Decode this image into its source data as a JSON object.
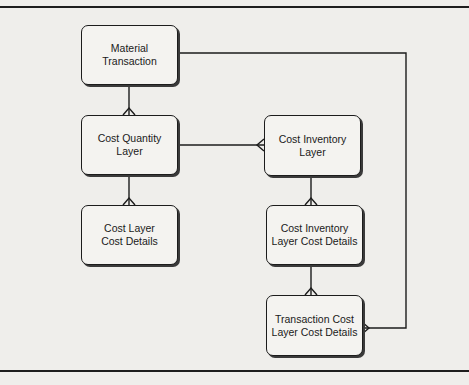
{
  "diagram": {
    "type": "entity-relationship",
    "entities": [
      {
        "id": "material_transaction",
        "label": "Material\nTransaction"
      },
      {
        "id": "cost_quantity_layer",
        "label": "Cost Quantity\nLayer"
      },
      {
        "id": "cost_layer_cost_details",
        "label": "Cost Layer\nCost Details"
      },
      {
        "id": "cost_inventory_layer",
        "label": "Cost Inventory\nLayer"
      },
      {
        "id": "cost_inventory_layer_cost_details",
        "label": "Cost Inventory\nLayer Cost Details"
      },
      {
        "id": "transaction_cost_layer_cost_details",
        "label": "Transaction Cost\nLayer Cost Details"
      }
    ],
    "relationships": [
      {
        "from": "material_transaction",
        "to": "cost_quantity_layer",
        "cardinality": "one-to-many"
      },
      {
        "from": "cost_quantity_layer",
        "to": "cost_layer_cost_details",
        "cardinality": "one-to-many"
      },
      {
        "from": "cost_quantity_layer",
        "to": "cost_inventory_layer",
        "cardinality": "one-to-many"
      },
      {
        "from": "cost_inventory_layer",
        "to": "cost_inventory_layer_cost_details",
        "cardinality": "one-to-many"
      },
      {
        "from": "cost_inventory_layer_cost_details",
        "to": "transaction_cost_layer_cost_details",
        "cardinality": "one-to-many"
      },
      {
        "from": "material_transaction",
        "to": "transaction_cost_layer_cost_details",
        "cardinality": "one-to-many"
      }
    ],
    "colors": {
      "line": "#1c1c1c",
      "background": "#efeeeb",
      "box_fill": "#f4f3f0"
    }
  }
}
